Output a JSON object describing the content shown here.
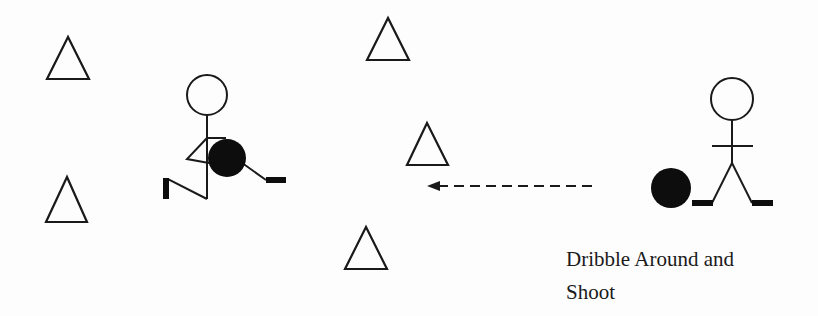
{
  "diagram": {
    "title": "Dribble Around and Shoot",
    "caption": {
      "line1": "Dribble Around and",
      "line2": "Shoot"
    },
    "colors": {
      "stroke": "#1a1a1a",
      "ball": "#0d0d0d",
      "background": "#fdfdfd"
    },
    "cones": [
      {
        "id": "cone-1",
        "apex": [
          68,
          37
        ],
        "base_y": 79,
        "base_x": [
          47,
          89
        ]
      },
      {
        "id": "cone-2",
        "apex": [
          67,
          177
        ],
        "base_y": 222,
        "base_x": [
          46,
          87
        ]
      },
      {
        "id": "cone-3",
        "apex": [
          388,
          18
        ],
        "base_y": 60,
        "base_x": [
          367,
          409
        ]
      },
      {
        "id": "cone-4",
        "apex": [
          427,
          123
        ],
        "base_y": 165,
        "base_x": [
          407,
          448
        ]
      },
      {
        "id": "cone-5",
        "apex": [
          366,
          227
        ],
        "base_y": 269,
        "base_x": [
          345,
          387
        ]
      }
    ],
    "players": [
      {
        "id": "dribbling-player",
        "pose": "running",
        "head_center": [
          207,
          95
        ],
        "ball_center": [
          227,
          158
        ]
      },
      {
        "id": "starting-player",
        "pose": "standing",
        "head_center": [
          732,
          99
        ],
        "ball_center": [
          671,
          188
        ]
      }
    ],
    "path": {
      "style": "dashed-arrow",
      "from": [
        592,
        186
      ],
      "to": [
        427,
        186
      ],
      "direction": "left"
    }
  }
}
